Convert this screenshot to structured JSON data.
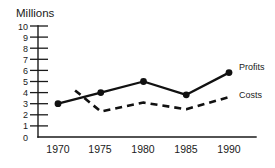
{
  "chart_data": {
    "type": "line",
    "title": "",
    "xlabel": "",
    "ylabel": "Millions",
    "ylim": [
      0,
      10
    ],
    "xlim": [
      1970,
      1990
    ],
    "grid": false,
    "legend_position": "inline-right",
    "categories": [
      "1970",
      "1975",
      "1980",
      "1985",
      "1990"
    ],
    "x": [
      1970,
      1975,
      1980,
      1985,
      1990
    ],
    "yticks": [
      "0",
      "1",
      "2",
      "3",
      "4",
      "5",
      "6",
      "7",
      "8",
      "9",
      "10"
    ],
    "series": [
      {
        "name": "Profits",
        "style": "solid",
        "markers": "filled-circle",
        "x": [
          1970,
          1975,
          1980,
          1985,
          1990
        ],
        "values": [
          3.0,
          4.0,
          5.0,
          3.8,
          5.8
        ]
      },
      {
        "name": "Costs",
        "style": "dashed",
        "markers": "none",
        "x": [
          1972,
          1975,
          1980,
          1985,
          1990
        ],
        "values": [
          4.2,
          2.3,
          3.1,
          2.5,
          3.6
        ]
      }
    ]
  },
  "labels": {
    "y_axis_title": "Millions",
    "series_profits": "Profits",
    "series_costs": "Costs"
  }
}
